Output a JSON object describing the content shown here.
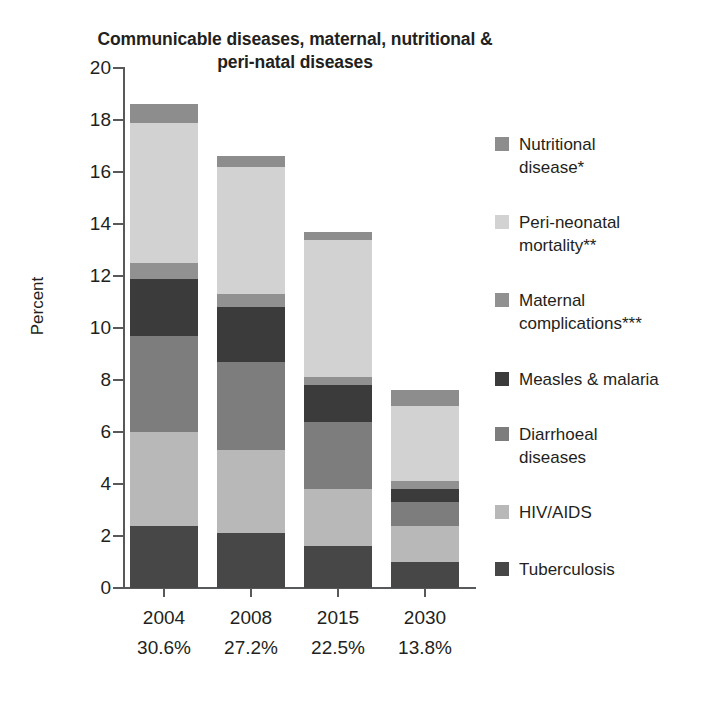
{
  "chart_data": {
    "type": "bar",
    "subtype": "stacked-bar",
    "title": "Communicable diseases, maternal, nutritional & peri-natal diseases",
    "title_line1": "Communicable diseases, maternal, nutritional &",
    "title_line2": "peri-natal diseases",
    "xlabel": "",
    "ylabel": "Percent",
    "ylim": [
      0,
      20
    ],
    "yticks": [
      0,
      2,
      4,
      6,
      8,
      10,
      12,
      14,
      16,
      18,
      20
    ],
    "ytick_labels": [
      "0",
      "2",
      "4",
      "6",
      "8",
      "10",
      "12",
      "14",
      "16",
      "18",
      "20"
    ],
    "grid": false,
    "legend_position": "right",
    "categories": [
      "2004",
      "2008",
      "2015",
      "2030"
    ],
    "category_sublabels": [
      "30.6%",
      "27.2%",
      "22.5%",
      "13.8%"
    ],
    "stack_order_bottom_to_top": [
      "Tuberculosis",
      "HIV/AIDS",
      "Diarrhoeal diseases",
      "Measles & malaria",
      "Maternal complications***",
      "Peri-neonatal mortality**",
      "Nutritional disease*"
    ],
    "series": [
      {
        "name": "Tuberculosis",
        "color": "#474747",
        "values": [
          2.4,
          2.1,
          1.6,
          1.0
        ]
      },
      {
        "name": "HIV/AIDS",
        "color": "#b8b8b8",
        "values": [
          3.6,
          3.2,
          2.2,
          1.4
        ]
      },
      {
        "name": "Diarrhoeal diseases",
        "color": "#7d7d7d",
        "values": [
          3.7,
          3.4,
          2.6,
          0.9
        ]
      },
      {
        "name": "Measles & malaria",
        "color": "#3b3b3b",
        "values": [
          2.2,
          2.1,
          1.4,
          0.5
        ]
      },
      {
        "name": "Maternal complications***",
        "color": "#919191",
        "values": [
          0.6,
          0.5,
          0.3,
          0.3
        ]
      },
      {
        "name": "Peri-neonatal mortality**",
        "color": "#d2d2d2",
        "values": [
          5.4,
          4.9,
          5.3,
          2.9
        ]
      },
      {
        "name": "Nutritional disease*",
        "color": "#8d8d8d",
        "values": [
          0.7,
          0.4,
          0.3,
          0.6
        ]
      }
    ],
    "totals": [
      18.6,
      16.6,
      13.7,
      7.6
    ],
    "legend_entries": [
      {
        "label": "Nutritional\ndisease*",
        "color": "#8d8d8d"
      },
      {
        "label": "Peri-neonatal\nmortality**",
        "color": "#d2d2d2"
      },
      {
        "label": "Maternal\ncomplications***",
        "color": "#919191"
      },
      {
        "label": "Measles & malaria",
        "color": "#3b3b3b"
      },
      {
        "label": "Diarrhoeal\ndiseases",
        "color": "#7d7d7d"
      },
      {
        "label": "HIV/AIDS",
        "color": "#b8b8b8"
      },
      {
        "label": "Tuberculosis",
        "color": "#474747"
      }
    ]
  },
  "axis": {
    "y_title": "Percent"
  }
}
